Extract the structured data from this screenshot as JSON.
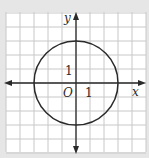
{
  "diagram": {
    "type": "coordinate-plane-circle",
    "grid": {
      "x_min": -5,
      "x_max": 5,
      "y_min": -5,
      "y_max": 5,
      "step": 1
    },
    "circle": {
      "center": [
        0,
        0
      ],
      "radius": 3
    },
    "labels": {
      "x_axis": "x",
      "y_axis": "y",
      "origin": "O",
      "x_tick": "1",
      "y_tick": "1"
    },
    "colors": {
      "background": "#e6e6e6",
      "grid_fill": "#ffffff",
      "grid_line": "#c8c8c8",
      "axis": "#2a2a2a",
      "circle": "#2a2a2a"
    }
  }
}
